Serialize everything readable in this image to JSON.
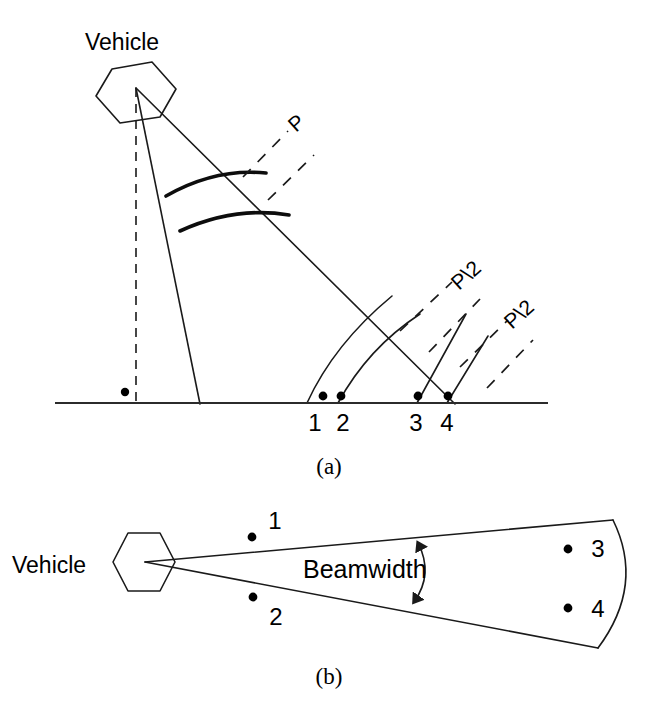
{
  "figure": {
    "background_color": "#ffffff",
    "line_color": "#1a1a1a",
    "width": 659,
    "height": 707
  },
  "panel_a": {
    "caption": "(a)",
    "vehicle_label": "Vehicle",
    "pulse_label": "P",
    "half_pulse_label_upper": "P\\2",
    "half_pulse_label_lower": "P\\2",
    "ground_points": [
      {
        "id": "1",
        "label": "1"
      },
      {
        "id": "2",
        "label": "2"
      },
      {
        "id": "3",
        "label": "3"
      },
      {
        "id": "4",
        "label": "4"
      }
    ]
  },
  "panel_b": {
    "caption": "(b)",
    "vehicle_label": "Vehicle",
    "beamwidth_label": "Beamwidth",
    "scene_points": [
      {
        "id": "1",
        "label": "1"
      },
      {
        "id": "2",
        "label": "2"
      },
      {
        "id": "3",
        "label": "3"
      },
      {
        "id": "4",
        "label": "4"
      }
    ]
  }
}
